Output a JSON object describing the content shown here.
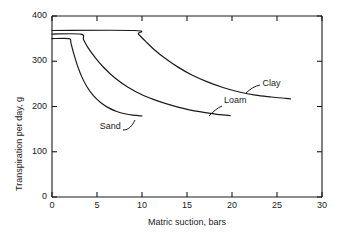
{
  "chart_data": {
    "type": "line",
    "title": "",
    "xlabel": "Matric suction, bars",
    "ylabel": "Transpiration per day, g",
    "xlim": [
      0,
      30
    ],
    "ylim": [
      0,
      400
    ],
    "xticks": [
      0,
      5,
      10,
      15,
      20,
      25,
      30
    ],
    "yticks": [
      0,
      100,
      200,
      300,
      400
    ],
    "xtick_labels": [
      "0",
      "5",
      "10",
      "15",
      "20",
      "25",
      "30"
    ],
    "ytick_labels": [
      "0",
      "100",
      "200",
      "300",
      "400"
    ],
    "grid": false,
    "legend_position": "inline-annotations",
    "series": [
      {
        "name": "Sand",
        "label": "Sand",
        "color": "#1a1a1a",
        "points": [
          [
            0.0,
            350
          ],
          [
            1.9,
            350
          ],
          [
            2.1,
            340
          ],
          [
            2.4,
            318
          ],
          [
            2.8,
            292
          ],
          [
            3.3,
            266
          ],
          [
            3.9,
            243
          ],
          [
            4.6,
            224
          ],
          [
            5.4,
            209
          ],
          [
            6.3,
            197
          ],
          [
            7.2,
            189
          ],
          [
            8.1,
            184
          ],
          [
            9.0,
            181
          ],
          [
            9.6,
            180
          ],
          [
            10.0,
            179
          ]
        ]
      },
      {
        "name": "Loam",
        "label": "Loam",
        "color": "#1a1a1a",
        "points": [
          [
            0.0,
            360
          ],
          [
            3.2,
            360
          ],
          [
            3.5,
            348
          ],
          [
            4.0,
            330
          ],
          [
            4.8,
            308
          ],
          [
            5.8,
            285
          ],
          [
            7.0,
            263
          ],
          [
            8.4,
            243
          ],
          [
            10.0,
            226
          ],
          [
            11.8,
            212
          ],
          [
            13.6,
            201
          ],
          [
            15.4,
            192
          ],
          [
            17.2,
            186
          ],
          [
            18.6,
            182
          ],
          [
            19.8,
            180
          ]
        ]
      },
      {
        "name": "Clay",
        "label": "Clay",
        "color": "#1a1a1a",
        "points": [
          [
            0.0,
            368
          ],
          [
            9.2,
            368
          ],
          [
            9.6,
            360
          ],
          [
            10.4,
            344
          ],
          [
            11.4,
            325
          ],
          [
            12.6,
            306
          ],
          [
            14.0,
            287
          ],
          [
            15.6,
            269
          ],
          [
            17.2,
            255
          ],
          [
            19.0,
            242
          ],
          [
            20.8,
            232
          ],
          [
            22.6,
            225
          ],
          [
            24.4,
            221
          ],
          [
            26.0,
            218
          ],
          [
            26.5,
            217
          ]
        ]
      }
    ],
    "annotations": [
      {
        "text": "Sand",
        "x": 5.3,
        "y": 155
      },
      {
        "text": "Loam",
        "x": 19.1,
        "y": 212
      },
      {
        "text": "Clay",
        "x": 23.4,
        "y": 249
      }
    ]
  }
}
